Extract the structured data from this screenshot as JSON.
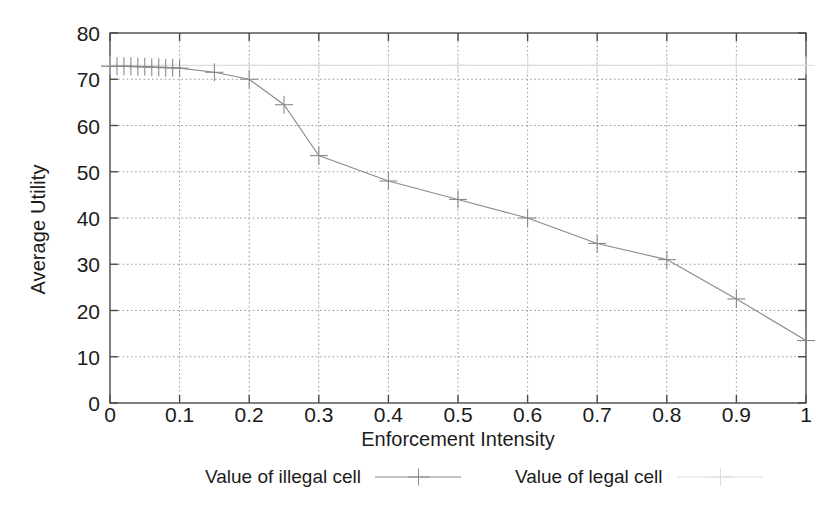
{
  "chart_data": {
    "type": "line",
    "title": "",
    "xlabel": "Enforcement Intensity",
    "ylabel": "Average Utility",
    "xlim": [
      0,
      1
    ],
    "ylim": [
      0,
      80
    ],
    "xticks": [
      "0",
      "0.1",
      "0.2",
      "0.3",
      "0.4",
      "0.5",
      "0.6",
      "0.7",
      "0.8",
      "0.9",
      "1"
    ],
    "xtick_values": [
      0,
      0.1,
      0.2,
      0.3,
      0.4,
      0.5,
      0.6,
      0.7,
      0.8,
      0.9,
      1
    ],
    "yticks": [
      "0",
      "10",
      "20",
      "30",
      "40",
      "50",
      "60",
      "70",
      "80"
    ],
    "ytick_values": [
      0,
      10,
      20,
      30,
      40,
      50,
      60,
      70,
      80
    ],
    "grid": true,
    "grid_style": "dotted",
    "legend_position": "below",
    "series": [
      {
        "name": "Value of illegal cell",
        "marker": "plus",
        "color": "#8a8a8a",
        "x": [
          0,
          0.01,
          0.02,
          0.03,
          0.04,
          0.05,
          0.06,
          0.07,
          0.08,
          0.09,
          0.1,
          0.15,
          0.2,
          0.25,
          0.3,
          0.4,
          0.5,
          0.6,
          0.7,
          0.8,
          0.9,
          1
        ],
        "values": [
          72.8,
          72.8,
          72.8,
          72.8,
          72.7,
          72.7,
          72.6,
          72.6,
          72.5,
          72.5,
          72.4,
          71.5,
          70.0,
          64.5,
          53.5,
          48.0,
          44.0,
          40.0,
          34.5,
          31.0,
          22.5,
          13.5
        ]
      },
      {
        "name": "Value of legal cell",
        "marker": "plus",
        "color": "#dcdcdc",
        "x": [
          0,
          0.1,
          0.2,
          0.3,
          0.4,
          0.5,
          0.6,
          0.7,
          0.8,
          0.9,
          1
        ],
        "values": [
          73.0,
          73.0,
          73.0,
          73.0,
          73.0,
          73.0,
          73.0,
          73.0,
          73.0,
          73.0,
          73.0
        ]
      }
    ]
  },
  "legend": {
    "entries": [
      {
        "label": "Value of illegal cell"
      },
      {
        "label": "Value of legal cell"
      }
    ]
  },
  "colors": {
    "frame": "#4a4a4a",
    "grid": "#9a9a9a",
    "series_illegal": "#8a8a8a",
    "series_legal": "#dcdcdc",
    "text": "#1b1b1b",
    "background": "#ffffff"
  }
}
